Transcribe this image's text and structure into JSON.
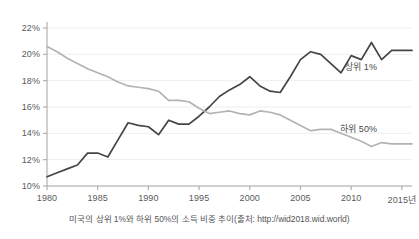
{
  "caption": "미국의 상위 1%와 하위 50%의 소득 비중 추이(출처: http://wid2018.wid.world)",
  "axes": {
    "y_ticks": [
      "10%",
      "12%",
      "14%",
      "16%",
      "18%",
      "20%",
      "22%"
    ],
    "x_ticks": [
      "1980",
      "1985",
      "1990",
      "1995",
      "2000",
      "2005",
      "2010",
      "2015년"
    ]
  },
  "labels": {
    "top1": "상위 1%",
    "bottom50": "하위 50%"
  },
  "colors": {
    "top1": "#454545",
    "bottom50": "#b3b3b3",
    "grid": "#eeeeee",
    "axis": "#aaaaaa",
    "text": "#5a5a5a"
  },
  "chart_data": {
    "type": "line",
    "title": "",
    "subtitle": "",
    "xlabel": "",
    "ylabel": "",
    "xlim": [
      1980,
      2016
    ],
    "ylim": [
      10,
      22
    ],
    "ytick_values": [
      10,
      12,
      14,
      16,
      18,
      20,
      22
    ],
    "ytick_labels": [
      "10%",
      "12%",
      "14%",
      "16%",
      "18%",
      "20%",
      "22%"
    ],
    "xtick_values": [
      1980,
      1985,
      1990,
      1995,
      2000,
      2005,
      2010,
      2015
    ],
    "xtick_labels": [
      "1980",
      "1985",
      "1990",
      "1995",
      "2000",
      "2005",
      "2010",
      "2015년"
    ],
    "grid": true,
    "grid_axis": "y",
    "legend": "inline-annotation",
    "units": "percent",
    "x": [
      1980,
      1981,
      1982,
      1983,
      1984,
      1985,
      1986,
      1987,
      1988,
      1989,
      1990,
      1991,
      1992,
      1993,
      1994,
      1995,
      1996,
      1997,
      1998,
      1999,
      2000,
      2001,
      2002,
      2003,
      2004,
      2005,
      2006,
      2007,
      2008,
      2009,
      2010,
      2011,
      2012,
      2013,
      2014,
      2015,
      2016
    ],
    "series": [
      {
        "name": "상위 1%",
        "color": "#454545",
        "values": [
          10.7,
          11.0,
          11.3,
          11.6,
          12.5,
          12.5,
          12.2,
          13.5,
          14.8,
          14.6,
          14.5,
          13.9,
          15.0,
          14.7,
          14.7,
          15.3,
          16.0,
          16.8,
          17.3,
          17.7,
          18.3,
          17.6,
          17.2,
          17.1,
          18.3,
          19.6,
          20.2,
          20.0,
          19.3,
          18.6,
          19.9,
          19.6,
          20.9,
          19.6,
          20.3,
          20.3,
          20.3
        ]
      },
      {
        "name": "하위 50%",
        "color": "#b3b3b3",
        "values": [
          20.6,
          20.2,
          19.7,
          19.3,
          18.9,
          18.6,
          18.3,
          17.9,
          17.6,
          17.5,
          17.4,
          17.2,
          16.5,
          16.5,
          16.4,
          15.9,
          15.5,
          15.6,
          15.7,
          15.5,
          15.4,
          15.7,
          15.6,
          15.4,
          15.0,
          14.6,
          14.2,
          14.3,
          14.3,
          14.0,
          13.7,
          13.4,
          13.0,
          13.3,
          13.2,
          13.2,
          13.2
        ]
      }
    ],
    "annotations": [
      {
        "text": "상위 1%",
        "series": "상위 1%",
        "position": "right"
      },
      {
        "text": "하위 50%",
        "series": "하위 50%",
        "position": "right"
      }
    ]
  }
}
